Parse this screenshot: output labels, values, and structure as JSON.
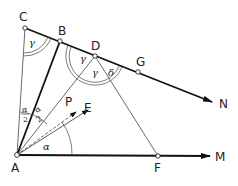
{
  "diagram": {
    "points": {
      "A": "A",
      "B": "B",
      "C": "C",
      "D": "D",
      "E": "E",
      "F": "F",
      "G": "G",
      "M": "M",
      "N": "N",
      "P": "P"
    },
    "angles": {
      "gamma": "γ",
      "delta": "δ",
      "alpha": "α",
      "half_alpha_num": "α",
      "half_alpha_den": "2"
    }
  }
}
